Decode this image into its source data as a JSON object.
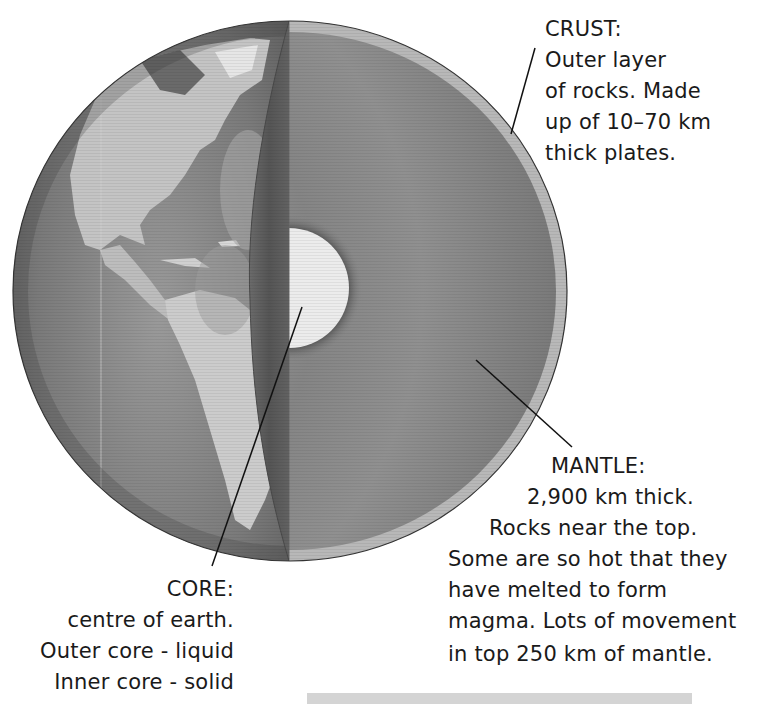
{
  "diagram": {
    "colors": {
      "ocean": "#7c7c7c",
      "land": "#c6c6c6",
      "cut_plane": "#5e5e5e",
      "mantle": "#8c8c8c",
      "crust": "#b8b8b8",
      "core": "#ececec",
      "core_halo": "#505050",
      "text": "#1a1a1a",
      "bottom_bar": "#d4d4d4"
    },
    "layers": [
      "crust",
      "mantle",
      "core"
    ]
  },
  "labels": {
    "crust": {
      "title": "CRUST:",
      "lines": [
        "Outer layer",
        "of rocks. Made",
        "up of 10–70 km",
        "thick plates."
      ]
    },
    "mantle": {
      "title": "MANTLE:",
      "lines": [
        "2,900 km thick.",
        "Rocks near the top.",
        "Some are so hot that they",
        "have melted to form",
        "magma. Lots of movement",
        "in top 250 km of mantle."
      ]
    },
    "core": {
      "title": "CORE:",
      "lines": [
        "centre of earth.",
        "Outer core - liquid",
        "Inner core - solid"
      ]
    }
  }
}
